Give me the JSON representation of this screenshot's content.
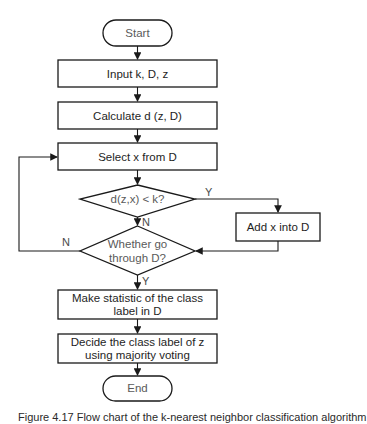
{
  "flowchart": {
    "nodes": {
      "start": {
        "type": "terminator",
        "label": "Start"
      },
      "input": {
        "type": "process",
        "label": "Input k, D, z"
      },
      "calculate": {
        "type": "process",
        "label": "Calculate d (z, D)"
      },
      "select": {
        "type": "process",
        "label": "Select x from D"
      },
      "decision_distance": {
        "type": "decision",
        "label": "d(z,x) < k?"
      },
      "add": {
        "type": "process",
        "label": "Add x into D"
      },
      "decision_traverse": {
        "type": "decision",
        "lines": [
          "Whether go",
          "through D?"
        ]
      },
      "statistic": {
        "type": "process",
        "lines": [
          "Make statistic of the class",
          "label in D"
        ]
      },
      "decide": {
        "type": "process",
        "lines": [
          "Decide the class label of z",
          "using majority voting"
        ]
      },
      "end": {
        "type": "terminator",
        "label": "End"
      }
    },
    "edges": [
      {
        "from": "start",
        "to": "input",
        "label": ""
      },
      {
        "from": "input",
        "to": "calculate",
        "label": ""
      },
      {
        "from": "calculate",
        "to": "select",
        "label": ""
      },
      {
        "from": "select",
        "to": "decision_distance",
        "label": ""
      },
      {
        "from": "decision_distance",
        "to": "add",
        "label": "Y"
      },
      {
        "from": "decision_distance",
        "to": "decision_traverse",
        "label": "N"
      },
      {
        "from": "add",
        "to": "decision_traverse",
        "label": ""
      },
      {
        "from": "decision_traverse",
        "to": "select",
        "label": "N"
      },
      {
        "from": "decision_traverse",
        "to": "statistic",
        "label": "Y"
      },
      {
        "from": "statistic",
        "to": "decide",
        "label": ""
      },
      {
        "from": "decide",
        "to": "end",
        "label": ""
      }
    ],
    "edge_labels": {
      "distance_yes": "Y",
      "distance_no": "N",
      "traverse_no": "N",
      "traverse_yes": "Y"
    }
  },
  "caption": "Figure 4.17 Flow chart of the k-nearest neighbor classification algorithm"
}
